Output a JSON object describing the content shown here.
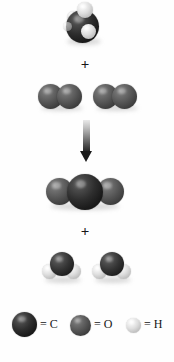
{
  "figure": {
    "equation": "CH4 + 2 O2 -> CO2 + 2 H2O",
    "operators": {
      "plus_reactants": "+",
      "plus_products": "+",
      "arrow": "down-arrow"
    }
  },
  "reactants": [
    {
      "name": "methane",
      "formula": "CH4",
      "atoms": [
        {
          "element": "C",
          "label": "carbon"
        },
        {
          "element": "H",
          "label": "hydrogen"
        },
        {
          "element": "H",
          "label": "hydrogen"
        },
        {
          "element": "H",
          "label": "hydrogen"
        },
        {
          "element": "H",
          "label": "hydrogen"
        }
      ]
    },
    {
      "name": "oxygen",
      "formula": "O2",
      "count": 2,
      "atoms": [
        {
          "element": "O",
          "label": "oxygen"
        },
        {
          "element": "O",
          "label": "oxygen"
        }
      ]
    }
  ],
  "products": [
    {
      "name": "carbon dioxide",
      "formula": "CO2",
      "atoms": [
        {
          "element": "O",
          "label": "oxygen"
        },
        {
          "element": "C",
          "label": "carbon"
        },
        {
          "element": "O",
          "label": "oxygen"
        }
      ]
    },
    {
      "name": "water",
      "formula": "H2O",
      "count": 2,
      "atoms": [
        {
          "element": "O",
          "label": "oxygen"
        },
        {
          "element": "H",
          "label": "hydrogen"
        },
        {
          "element": "H",
          "label": "hydrogen"
        }
      ]
    }
  ],
  "legend": {
    "items": [
      {
        "key": "carbon",
        "element": "C",
        "label": "= C",
        "color": "#1a1a1a"
      },
      {
        "key": "oxygen",
        "element": "O",
        "label": "= O",
        "color": "#4d4d4d"
      },
      {
        "key": "hydrogen",
        "element": "H",
        "label": "= H",
        "color": "#dcdcdc"
      }
    ]
  },
  "colors": {
    "background": "#ffffff",
    "carbon": "#1a1a1a",
    "oxygen": "#4d4d4d",
    "hydrogen": "#dcdcdc",
    "text": "#151515",
    "arrow_top": "#e9e9e9",
    "arrow_bottom": "#1b1b1b"
  }
}
